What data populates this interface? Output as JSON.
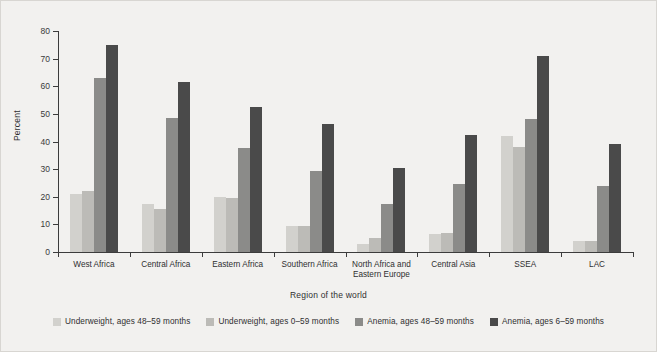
{
  "chart_data": {
    "type": "bar",
    "title": "",
    "xlabel": "Region of the world",
    "ylabel": "Percent",
    "ylim": [
      0,
      80
    ],
    "yticks": [
      0,
      10,
      20,
      30,
      40,
      50,
      60,
      70,
      80
    ],
    "grid": false,
    "legend_position": "bottom",
    "categories": [
      "West Africa",
      "Central Africa",
      "Eastern Africa",
      "Southern Africa",
      "North Africa and\nEastern Europe",
      "Central Asia",
      "SSEA",
      "LAC"
    ],
    "series": [
      {
        "name": "Underweight, ages 48–59 months",
        "color": "#d2d1cd",
        "values": [
          21,
          17.5,
          20,
          9.5,
          3,
          6.5,
          42,
          4
        ]
      },
      {
        "name": "Underweight, ages 0–59 months",
        "color": "#bcbbb7",
        "values": [
          22,
          15.5,
          19.5,
          9.5,
          5,
          7,
          38,
          4
        ]
      },
      {
        "name": "Anemia, ages 48–59 months",
        "color": "#8b8b89",
        "values": [
          63,
          48.5,
          37.5,
          29.5,
          17.5,
          24.5,
          48,
          24
        ]
      },
      {
        "name": "Anemia, ages 6–59 months",
        "color": "#4a4a4a",
        "values": [
          75,
          61.5,
          52.5,
          46.5,
          30.5,
          42.5,
          71,
          39
        ]
      }
    ]
  },
  "figure": {
    "background_color": "#f2f1ef",
    "axis_color": "#3c3c3c",
    "text_color": "#2f2f2f"
  }
}
